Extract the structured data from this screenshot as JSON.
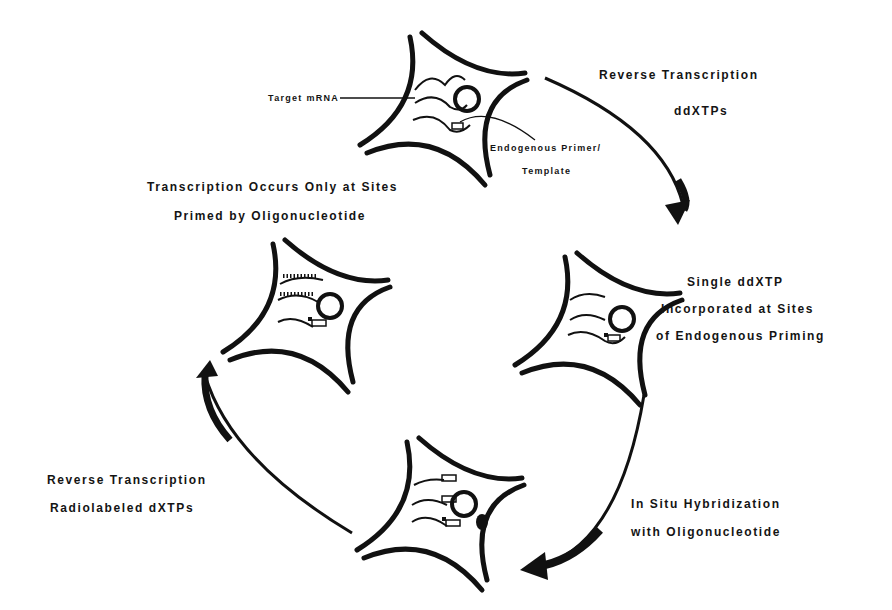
{
  "diagram": {
    "type": "cycle",
    "stages": [
      {
        "id": "stage-1",
        "position": "top",
        "callouts": [
          {
            "label": "Target mRNA"
          },
          {
            "label_line1": "Endogenous Primer/",
            "label_line2": "Template"
          }
        ]
      },
      {
        "id": "stage-2",
        "position": "right",
        "caption_lines": [
          "Single ddXTP",
          "Incorporated at Sites",
          "of Endogenous Priming"
        ]
      },
      {
        "id": "stage-3",
        "position": "bottom",
        "caption_lines": []
      },
      {
        "id": "stage-4",
        "position": "left",
        "caption_lines": [
          "Transcription Occurs Only at Sites",
          "Primed by Oligonucleotide"
        ]
      }
    ],
    "arrows": [
      {
        "from": "stage-1",
        "to": "stage-2",
        "label_lines": [
          "Reverse Transcription",
          "ddXTPs"
        ]
      },
      {
        "from": "stage-2",
        "to": "stage-3",
        "label_lines": [
          "In Situ Hybridization",
          "with Oligonucleotide"
        ]
      },
      {
        "from": "stage-3",
        "to": "stage-4",
        "label_lines": [
          "Reverse Transcription",
          "Radiolabeled dXTPs"
        ]
      }
    ],
    "colors": {
      "ink": "#111111",
      "background": "#ffffff"
    }
  }
}
